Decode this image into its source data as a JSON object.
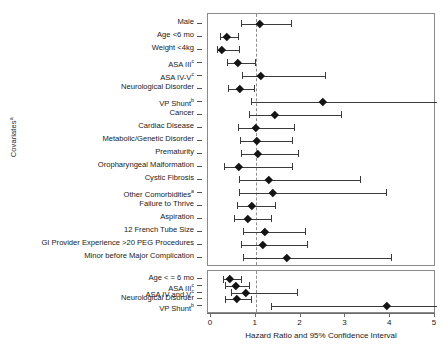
{
  "figure": {
    "y_axis_title": "Covariates",
    "y_axis_title_superscript": "a",
    "x_axis_title": "Hazard Ratio and 95% Confidence Interval",
    "reference_line_value": 1
  },
  "axis": {
    "ticks": [
      0,
      1,
      2,
      3,
      4,
      5
    ],
    "tick_labels": [
      "0",
      "1",
      "2",
      "3",
      "4",
      "5"
    ],
    "xlim": [
      0,
      5
    ]
  },
  "chart_data": {
    "type": "forest",
    "title": "",
    "xlabel": "Hazard Ratio and 95% Confidence Interval",
    "ylabel": "Covariates",
    "xlim": [
      0,
      5
    ],
    "ticks": [
      0,
      1,
      2,
      3,
      4,
      5
    ],
    "reference_line": 1,
    "grid": false,
    "legend": "none",
    "panels": [
      {
        "name": "panel-top",
        "rows": [
          {
            "label": "Male",
            "sup": "",
            "hr": 1.1,
            "lo": 0.68,
            "hi": 1.78
          },
          {
            "label": "Age <6 mo",
            "sup": "",
            "hr": 0.35,
            "lo": 0.2,
            "hi": 0.6
          },
          {
            "label": "Weight <4kg",
            "sup": "",
            "hr": 0.24,
            "lo": 0.14,
            "hi": 0.63
          },
          {
            "label": "ASA III",
            "sup": "c",
            "hr": 0.6,
            "lo": 0.35,
            "hi": 0.98
          },
          {
            "label": "ASA IV-V",
            "sup": "c",
            "hr": 1.12,
            "lo": 0.7,
            "hi": 2.55
          },
          {
            "label": "Neurological Disorder",
            "sup": "",
            "hr": 0.65,
            "lo": 0.38,
            "hi": 0.95
          },
          {
            "label": "VP Shunt",
            "sup": "b",
            "hr": 2.5,
            "lo": 0.9,
            "hi": 5.1
          },
          {
            "label": "Cancer",
            "sup": "",
            "hr": 1.42,
            "lo": 0.85,
            "hi": 2.9
          },
          {
            "label": "Cardiac Disease",
            "sup": "",
            "hr": 1.0,
            "lo": 0.6,
            "hi": 1.85
          },
          {
            "label": "Metabolic/Genetic Disorder",
            "sup": "",
            "hr": 1.02,
            "lo": 0.65,
            "hi": 1.8
          },
          {
            "label": "Prematurity",
            "sup": "",
            "hr": 1.05,
            "lo": 0.68,
            "hi": 1.95
          },
          {
            "label": "Oropharyngeal Malformation",
            "sup": "",
            "hr": 0.63,
            "lo": 0.28,
            "hi": 1.8
          },
          {
            "label": "Cystic Fibrosis",
            "sup": "",
            "hr": 1.28,
            "lo": 0.62,
            "hi": 3.32
          },
          {
            "label": "Other Comorbidities",
            "sup": "a",
            "hr": 1.38,
            "lo": 0.62,
            "hi": 3.9
          },
          {
            "label": "Failure to Thrive",
            "sup": "",
            "hr": 0.9,
            "lo": 0.58,
            "hi": 1.42
          },
          {
            "label": "Aspiration",
            "sup": "",
            "hr": 0.82,
            "lo": 0.52,
            "hi": 1.35
          },
          {
            "label": "12 French Tube Size",
            "sup": "",
            "hr": 1.2,
            "lo": 0.72,
            "hi": 2.1
          },
          {
            "label": "GI Provider Experience >20 PEG Procedures",
            "sup": "",
            "hr": 1.15,
            "lo": 0.66,
            "hi": 2.15
          },
          {
            "label": "Minor before Major Complication",
            "sup": "",
            "hr": 1.7,
            "lo": 0.72,
            "hi": 4.02
          }
        ]
      },
      {
        "name": "panel-bottom",
        "rows": [
          {
            "label": "Age < = 6 mo",
            "sup": "",
            "hr": 0.43,
            "lo": 0.26,
            "hi": 0.68
          },
          {
            "label": "ASA III",
            "sup": "c",
            "hr": 0.55,
            "lo": 0.32,
            "hi": 0.85
          },
          {
            "label": "ASA IV and V",
            "sup": "c",
            "hr": 0.78,
            "lo": 0.45,
            "hi": 1.92
          },
          {
            "label": "Neurological Disorder",
            "sup": "",
            "hr": 0.58,
            "lo": 0.32,
            "hi": 0.9
          },
          {
            "label": "VP Shunt",
            "sup": "b",
            "hr": 3.92,
            "lo": 1.35,
            "hi": 5.05
          }
        ]
      }
    ]
  }
}
